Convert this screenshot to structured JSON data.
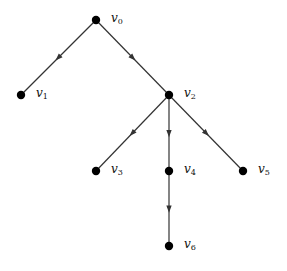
{
  "diagram": {
    "type": "directed tree",
    "nodes": [
      {
        "id": "v0",
        "label": "v",
        "sub": "0",
        "x": 96,
        "y": 20
      },
      {
        "id": "v1",
        "label": "v",
        "sub": "1",
        "x": 21,
        "y": 95
      },
      {
        "id": "v2",
        "label": "v",
        "sub": "2",
        "x": 169,
        "y": 95
      },
      {
        "id": "v3",
        "label": "v",
        "sub": "3",
        "x": 96,
        "y": 171
      },
      {
        "id": "v4",
        "label": "v",
        "sub": "4",
        "x": 169,
        "y": 171
      },
      {
        "id": "v5",
        "label": "v",
        "sub": "5",
        "x": 243,
        "y": 171
      },
      {
        "id": "v6",
        "label": "v",
        "sub": "6",
        "x": 169,
        "y": 246
      }
    ],
    "edges": [
      {
        "from": "v0",
        "to": "v1"
      },
      {
        "from": "v0",
        "to": "v2"
      },
      {
        "from": "v2",
        "to": "v3"
      },
      {
        "from": "v2",
        "to": "v4"
      },
      {
        "from": "v2",
        "to": "v5"
      },
      {
        "from": "v4",
        "to": "v6"
      }
    ],
    "colors": {
      "node": "#000000",
      "edge": "#333333",
      "background": "#ffffff"
    }
  }
}
